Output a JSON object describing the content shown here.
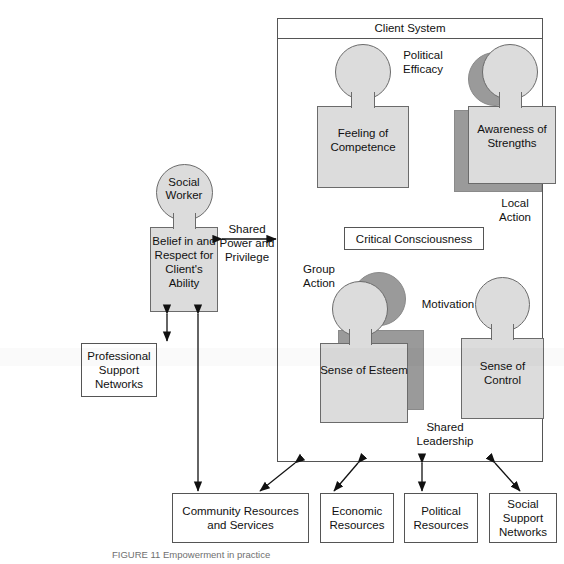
{
  "figure": {
    "title": "Client System",
    "caption": "FIGURE 11   Empowerment in practice"
  },
  "client_system": {
    "header_label": "Client System",
    "people": [
      {
        "id": "feeling-of-competence",
        "label": "Feeling\nof\nCompetence",
        "has_shadow": false
      },
      {
        "id": "awareness-of-strengths",
        "label": "Awareness\nof\nStrengths",
        "has_shadow": true
      },
      {
        "id": "sense-of-esteem",
        "label": "Sense\nof\nEsteem",
        "has_shadow": true
      },
      {
        "id": "sense-of-control",
        "label": "Sense\nof\nControl",
        "has_shadow": false
      }
    ],
    "inner_box": {
      "label": "Critical Consciousness"
    },
    "annotations": [
      {
        "id": "political-efficacy",
        "label": "Political\nEfficacy"
      },
      {
        "id": "local-action",
        "label": "Local\nAction"
      },
      {
        "id": "group-action",
        "label": "Group\nAction"
      },
      {
        "id": "motivation",
        "label": "Motivation"
      },
      {
        "id": "shared-leadership",
        "label": "Shared\nLeadership"
      }
    ]
  },
  "social_worker": {
    "head_label": "Social\nWorker",
    "body_label": "Belief in\nand\nRespect for\nClient's\nAbility"
  },
  "shared_power": {
    "label": "Shared\nPower and\nPrivilege"
  },
  "professional_support": {
    "label": "Professional\nSupport\nNetworks"
  },
  "resource_boxes": [
    {
      "id": "community-resources-and-services",
      "label": "Community Resources\nand Services"
    },
    {
      "id": "economic-resources",
      "label": "Economic\nResources"
    },
    {
      "id": "political-resources",
      "label": "Political\nResources"
    },
    {
      "id": "social-support-networks",
      "label": "Social\nSupport\nNetworks"
    }
  ],
  "colors": {
    "figure_fill": "#dcdcdc",
    "figure_shadow": "#9a9a9a",
    "stroke": "#555555",
    "text": "#111111"
  }
}
